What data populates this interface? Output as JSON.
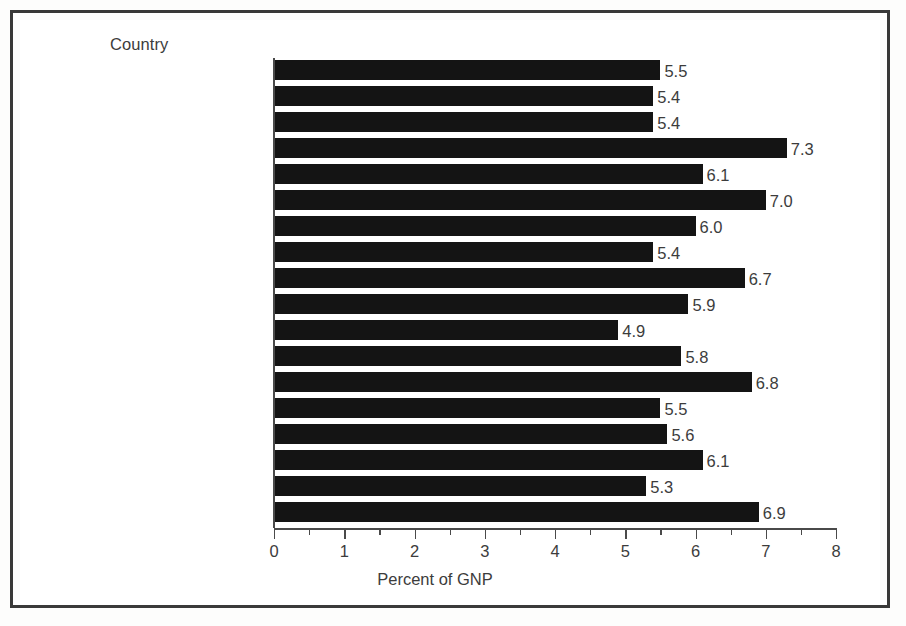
{
  "chart_data": {
    "type": "bar",
    "orientation": "horizontal",
    "title": "",
    "subtitle": "",
    "category_axis_header": "Country",
    "xlabel": "Percent of GNP",
    "ylabel": "",
    "xlim": [
      0,
      8
    ],
    "xticks": [
      0,
      1,
      2,
      3,
      4,
      5,
      6,
      7,
      8
    ],
    "xtick_labels": [
      "0",
      "1",
      "2",
      "3",
      "4",
      "5",
      "6",
      "7",
      "8"
    ],
    "minor_tick_interval": 0.5,
    "grid": false,
    "legend": false,
    "bar_color": "#141414",
    "text_color": "#3c3c3c",
    "value_label_format": "one-decimal",
    "footnote_marker": "1",
    "categories": [
      "Australia",
      "Austria",
      "Belgium",
      "Canada",
      "Denmark",
      "Finland",
      "France",
      "Former West Germany",
      "Hungary",
      "Ireland",
      "Japan",
      "Netherlands",
      "Norway",
      "Portugal",
      "Spain",
      "Sweden",
      "United Kingdom",
      "United States"
    ],
    "category_footnotes": [
      "",
      "1",
      "",
      "",
      "",
      "",
      "",
      "",
      "",
      "",
      "",
      "",
      "1",
      "1",
      "",
      "",
      "1",
      ""
    ],
    "values": [
      5.5,
      5.4,
      5.4,
      7.3,
      6.1,
      7.0,
      6.0,
      5.4,
      6.7,
      5.9,
      4.9,
      5.8,
      6.8,
      5.5,
      5.6,
      6.1,
      5.3,
      6.9
    ],
    "value_labels": [
      "5.5",
      "5.4",
      "5.4",
      "7.3",
      "6.1",
      "7.0",
      "6.0",
      "5.4",
      "6.7",
      "5.9",
      "4.9",
      "5.8",
      "6.8",
      "5.5",
      "5.6",
      "6.1",
      "5.3",
      "6.9"
    ]
  }
}
